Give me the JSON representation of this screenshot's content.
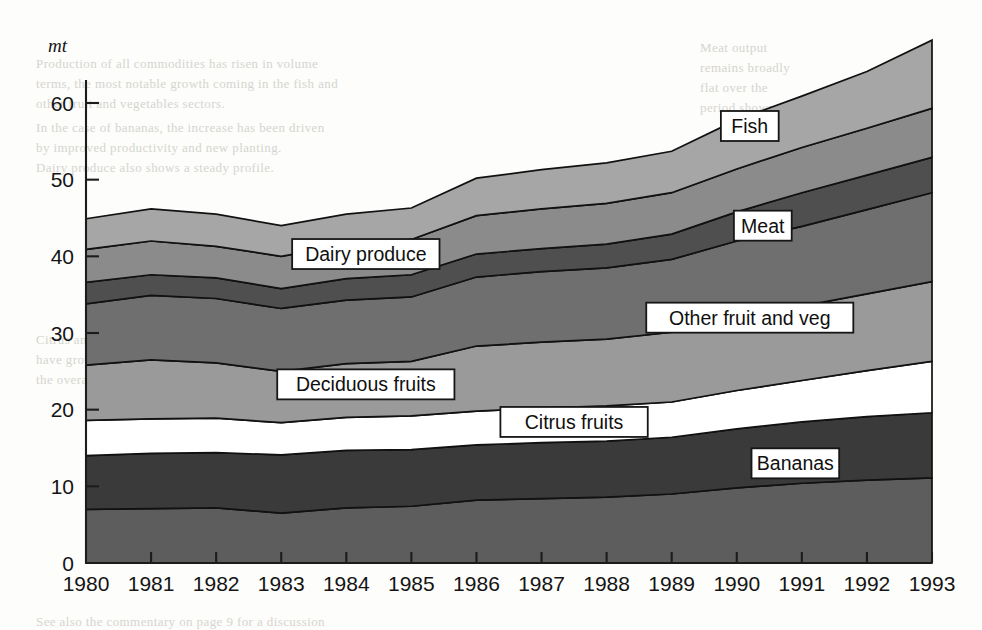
{
  "chart_data": {
    "type": "area",
    "stacked": true,
    "title": "",
    "subtitle": "",
    "xlabel": "",
    "ylabel": "mt",
    "ylabel_style": "italic",
    "categories": [
      "1980",
      "1981",
      "1982",
      "1983",
      "1984",
      "1985",
      "1986",
      "1987",
      "1988",
      "1989",
      "1990",
      "1991",
      "1992",
      "1993"
    ],
    "x": [
      1980,
      1981,
      1982,
      1983,
      1984,
      1985,
      1986,
      1987,
      1988,
      1989,
      1990,
      1991,
      1992,
      1993
    ],
    "ylim": [
      0,
      63
    ],
    "yticks": [
      0,
      10,
      20,
      30,
      40,
      50,
      60
    ],
    "ytick_labels": [
      "0",
      "10",
      "20",
      "30",
      "40",
      "50",
      "60"
    ],
    "grid": false,
    "legend": "inline-labels",
    "stack_order_bottom_to_top": [
      "Bananas lower band",
      "Bananas",
      "Citrus fruits",
      "Deciduous fruits",
      "Other fruit and veg",
      "Meat",
      "Dairy produce",
      "Fish"
    ],
    "series": [
      {
        "name": "Bananas lower band",
        "label": "",
        "color": "#5d5d5d",
        "values": [
          7.0,
          7.1,
          7.2,
          6.5,
          7.2,
          7.4,
          8.2,
          8.4,
          8.6,
          9.0,
          9.8,
          10.4,
          10.8,
          11.1
        ]
      },
      {
        "name": "Bananas",
        "label": "Bananas",
        "color": "#3a3a3a",
        "values": [
          7.0,
          7.2,
          7.2,
          7.6,
          7.5,
          7.4,
          7.2,
          7.3,
          7.3,
          7.4,
          7.7,
          8.0,
          8.3,
          8.5
        ]
      },
      {
        "name": "Citrus fruits",
        "label": "Citrus fruits",
        "color": "#ffffff",
        "values": [
          4.6,
          4.5,
          4.5,
          4.2,
          4.3,
          4.4,
          4.4,
          4.5,
          4.6,
          4.6,
          5.0,
          5.4,
          6.0,
          6.7
        ]
      },
      {
        "name": "Deciduous fruits",
        "label": "Deciduous fruits",
        "color": "#9a9a9a",
        "values": [
          7.2,
          7.7,
          7.2,
          6.7,
          7.0,
          7.1,
          8.5,
          8.6,
          8.7,
          9.1,
          9.5,
          9.7,
          10.0,
          10.4
        ]
      },
      {
        "name": "Other fruit and veg",
        "label": "Other fruit and veg",
        "color": "#6f6f6f",
        "values": [
          8.0,
          8.4,
          8.4,
          8.2,
          8.3,
          8.4,
          9.0,
          9.2,
          9.3,
          9.5,
          10.0,
          10.4,
          11.0,
          11.6
        ]
      },
      {
        "name": "Meat",
        "label": "Meat",
        "color": "#4f4f4f",
        "values": [
          2.8,
          2.7,
          2.7,
          2.6,
          2.8,
          2.9,
          3.0,
          3.0,
          3.1,
          3.3,
          3.8,
          4.4,
          4.5,
          4.6
        ]
      },
      {
        "name": "Dairy produce",
        "label": "Dairy produce",
        "color": "#8b8b8b",
        "values": [
          4.3,
          4.4,
          4.1,
          4.2,
          4.4,
          4.6,
          5.0,
          5.2,
          5.3,
          5.4,
          5.6,
          5.9,
          6.1,
          6.4
        ]
      },
      {
        "name": "Fish",
        "label": "Fish",
        "color": "#a6a6a6",
        "values": [
          4.0,
          4.2,
          4.2,
          4.0,
          4.0,
          4.1,
          4.9,
          5.1,
          5.3,
          5.4,
          6.4,
          6.7,
          7.4,
          8.9
        ]
      }
    ],
    "totals": [
      45.0,
      46.2,
      45.5,
      44.0,
      45.5,
      46.3,
      50.2,
      51.3,
      52.2,
      53.7,
      57.8,
      60.9,
      64.1,
      68.2
    ],
    "annotations": [
      {
        "text": "Fish",
        "x": 1990.2,
        "y": 57.0
      },
      {
        "text": "Meat",
        "x": 1990.4,
        "y": 44.0
      },
      {
        "text": "Other fruit and veg",
        "x": 1990.2,
        "y": 32.0
      },
      {
        "text": "Dairy produce",
        "x": 1984.3,
        "y": 40.3
      },
      {
        "text": "Deciduous fruits",
        "x": 1984.3,
        "y": 23.3
      },
      {
        "text": "Citrus fruits",
        "x": 1987.5,
        "y": 18.4
      },
      {
        "text": "Bananas",
        "x": 1990.9,
        "y": 13.0
      }
    ]
  },
  "ghost_text": [
    {
      "text": "Production of all commodities has risen in volume",
      "x": 36,
      "y": 56
    },
    {
      "text": "terms, the most notable growth coming in the fish and",
      "x": 36,
      "y": 76
    },
    {
      "text": "other fruit and vegetables sectors.",
      "x": 36,
      "y": 96
    },
    {
      "text": "In the case of bananas, the increase has been driven",
      "x": 36,
      "y": 120
    },
    {
      "text": "by improved productivity and new planting.",
      "x": 36,
      "y": 140
    },
    {
      "text": "Dairy produce also shows a steady profile.",
      "x": 36,
      "y": 160
    },
    {
      "text": "Meat output",
      "x": 700,
      "y": 40
    },
    {
      "text": "remains broadly",
      "x": 700,
      "y": 60
    },
    {
      "text": "flat over the",
      "x": 700,
      "y": 80
    },
    {
      "text": "period shown.",
      "x": 700,
      "y": 100
    },
    {
      "text": "Citrus and deciduous fruit volumes",
      "x": 36,
      "y": 332
    },
    {
      "text": "have grown more slowly than",
      "x": 36,
      "y": 352
    },
    {
      "text": "the overall total.",
      "x": 36,
      "y": 372
    },
    {
      "text": "See also the commentary on page 9 for a discussion",
      "x": 36,
      "y": 614
    }
  ]
}
